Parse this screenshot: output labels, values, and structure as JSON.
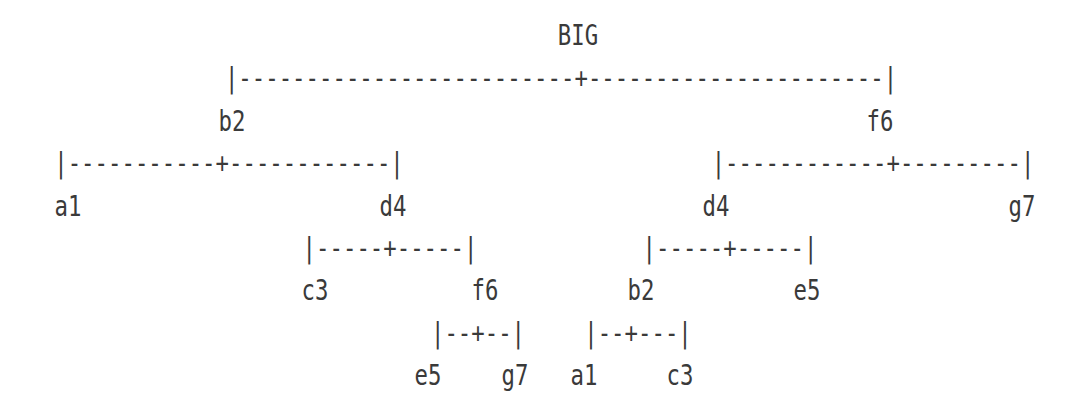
{
  "colors": {
    "ink": "#3a3a3a",
    "background": "#ffffff"
  },
  "figure": {
    "description_root": "BIG",
    "rows": [
      {
        "type": "label",
        "items": [
          {
            "text": "BIG"
          }
        ]
      },
      {
        "type": "line",
        "items": [
          {
            "text": "|-------------------------+----------------------|"
          }
        ]
      },
      {
        "type": "label",
        "items": [
          {
            "text": "b2"
          },
          {
            "text": "f6"
          }
        ]
      },
      {
        "type": "line",
        "items": [
          {
            "text": "|-----------+------------|"
          },
          {
            "text": "|------------+---------|"
          }
        ]
      },
      {
        "type": "label",
        "items": [
          {
            "text": "a1"
          },
          {
            "text": "d4"
          },
          {
            "text": "d4"
          },
          {
            "text": "g7"
          }
        ]
      },
      {
        "type": "line",
        "items": [
          {
            "text": "|-----+-----|"
          },
          {
            "text": "|-----+-----|"
          }
        ]
      },
      {
        "type": "label",
        "items": [
          {
            "text": "c3"
          },
          {
            "text": "f6"
          },
          {
            "text": "b2"
          },
          {
            "text": "e5"
          }
        ]
      },
      {
        "type": "line",
        "items": [
          {
            "text": "|--+--|"
          },
          {
            "text": "|--+---|"
          }
        ]
      },
      {
        "type": "label",
        "items": [
          {
            "text": "e5"
          },
          {
            "text": "g7"
          },
          {
            "text": "a1"
          },
          {
            "text": "c3"
          }
        ]
      }
    ]
  }
}
